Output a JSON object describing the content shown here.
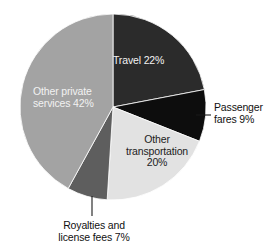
{
  "chart_data": {
    "type": "pie",
    "title": "",
    "subtitle": "",
    "xlabel": "",
    "ylabel": "",
    "legend_position": "none",
    "grid": false,
    "units": "percent",
    "start_angle_deg": 0,
    "direction": "clockwise",
    "categories": [
      "Travel",
      "Passenger fares",
      "Other transportation",
      "Royalties and license fees",
      "Other private services"
    ],
    "values": [
      22,
      9,
      20,
      7,
      42
    ],
    "slices": [
      {
        "name": "Travel",
        "value": 22,
        "value_text": "22%",
        "label_text": "Travel 22%",
        "color": "#2b2b2b",
        "label_placement": "inside",
        "label_color": "#f2f2f2"
      },
      {
        "name": "Passenger fares",
        "value": 9,
        "value_text": "9%",
        "label_line_1": "Passenger",
        "label_line_2": "fares 9%",
        "color": "#0d0d0d",
        "label_placement": "outside-leader",
        "label_color": "#111111"
      },
      {
        "name": "Other transportation",
        "value": 20,
        "value_text": "20%",
        "label_line_1": "Other",
        "label_line_2": "transportation",
        "label_line_3": "20%",
        "color": "#e2e2e2",
        "label_placement": "inside",
        "label_color": "#1c1c1c"
      },
      {
        "name": "Royalties and license fees",
        "value": 7,
        "value_text": "7%",
        "label_line_1": "Royalties and",
        "label_line_2": "license fees 7%",
        "color": "#5e5e5e",
        "label_placement": "outside-leader",
        "label_color": "#111111"
      },
      {
        "name": "Other private services",
        "value": 42,
        "value_text": "42%",
        "label_line_1": "Other private",
        "label_line_2": "services 42%",
        "color": "#a3a3a3",
        "label_placement": "inside",
        "label_color": "#f2f2f2"
      }
    ],
    "geometry": {
      "center_x": 113,
      "center_y": 107,
      "radius": 93
    },
    "background_color": "#ffffff"
  }
}
